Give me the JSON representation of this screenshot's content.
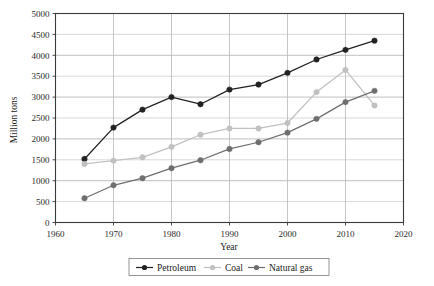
{
  "chart_data": {
    "type": "line",
    "title": "",
    "xlabel": "Year",
    "ylabel": "Million tons",
    "xlim": [
      1960,
      2020
    ],
    "ylim": [
      0,
      5000
    ],
    "xticks": [
      1960,
      1970,
      1980,
      1990,
      2000,
      2010,
      2020
    ],
    "yticks": [
      0,
      500,
      1000,
      1500,
      2000,
      2500,
      3000,
      3500,
      4000,
      4500,
      5000
    ],
    "grid": true,
    "legend_position": "bottom",
    "x": [
      1965,
      1970,
      1975,
      1980,
      1985,
      1990,
      1995,
      2000,
      2005,
      2010,
      2015
    ],
    "series": [
      {
        "name": "Petroleum",
        "color": "#222222",
        "marker": "circle",
        "values": [
          1520,
          2270,
          2700,
          3000,
          2830,
          3180,
          3300,
          3580,
          3900,
          4130,
          4350
        ]
      },
      {
        "name": "Coal",
        "color": "#c0c0c0",
        "marker": "circle",
        "values": [
          1400,
          1480,
          1560,
          1810,
          2100,
          2250,
          2250,
          2380,
          3120,
          3650,
          2800
        ]
      },
      {
        "name": "Natural gas",
        "color": "#6e6e6e",
        "marker": "circle",
        "values": [
          580,
          890,
          1060,
          1300,
          1490,
          1760,
          1920,
          2150,
          2480,
          2880,
          3150
        ]
      }
    ]
  },
  "axis": {
    "y_title": "Million tons",
    "x_title": "Year",
    "y_tick_labels": [
      "5000",
      "4500",
      "4000",
      "3500",
      "3000",
      "2500",
      "2000",
      "1500",
      "1000",
      "500",
      "0"
    ],
    "x_tick_labels": [
      "1960",
      "1970",
      "1980",
      "1990",
      "2000",
      "2010",
      "2020"
    ]
  },
  "legend": {
    "items": [
      {
        "label": "Petroleum",
        "color": "#222222"
      },
      {
        "label": "Coal",
        "color": "#c0c0c0"
      },
      {
        "label": "Natural gas",
        "color": "#6e6e6e"
      }
    ]
  },
  "style": {
    "plot_border_color": "#3a3a3a",
    "grid_color": "#b8b8b8",
    "background": "#ffffff"
  }
}
